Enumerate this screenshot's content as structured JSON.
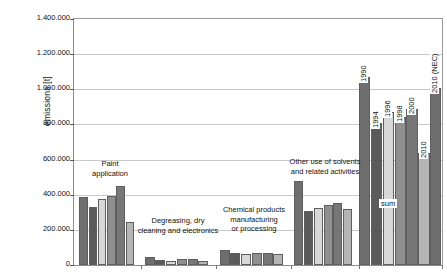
{
  "chart_data": {
    "type": "bar",
    "title": "",
    "xlabel": "",
    "ylabel": "emissions [t]",
    "ylim": [
      0,
      1400000
    ],
    "ytick_labels": [
      "0",
      "200.000",
      "400.000",
      "600.000",
      "800.000",
      "1.000.000",
      "1.200.000",
      "1.400.000"
    ],
    "ytick_values": [
      0,
      200000,
      400000,
      600000,
      800000,
      1000000,
      1200000,
      1400000
    ],
    "grid": "horizontal",
    "legend": "none",
    "series": [
      {
        "name": "1990",
        "color": "#6e6e6e"
      },
      {
        "name": "1994",
        "color": "#5a5a5a"
      },
      {
        "name": "1996",
        "color": "#d8d8d8"
      },
      {
        "name": "1998",
        "color": "#8f8f8f"
      },
      {
        "name": "2000",
        "color": "#777777"
      },
      {
        "name": "2010",
        "color": "#b5b5b5"
      },
      {
        "name": "2010 (NEC)",
        "color": "#6e6e6e"
      }
    ],
    "categories": [
      "Paint application",
      "Degreasing, dry cleaning and electronics",
      "Chemical products manufacturing or processing",
      "Other use of solvents and related activities",
      "sum"
    ],
    "groups": [
      {
        "category": "Paint application",
        "label_lines": "Paint\napplication",
        "values": [
          385000,
          330000,
          375000,
          395000,
          450000,
          245000
        ]
      },
      {
        "category": "Degreasing, dry cleaning and electronics",
        "label_lines": "Degreasing, dry\ncleaning and electronics",
        "values": [
          47000,
          27000,
          25000,
          32000,
          32000,
          22000
        ]
      },
      {
        "category": "Chemical products manufacturing or processing",
        "label_lines": "Chemical products\nmanufacturing\nor processing",
        "values": [
          85000,
          68000,
          63000,
          67000,
          67000,
          63000
        ]
      },
      {
        "category": "Other use of solvents and related activities",
        "label_lines": "Other use of solvents\nand related activities",
        "values": [
          480000,
          310000,
          325000,
          340000,
          355000,
          320000
        ]
      },
      {
        "category": "sum",
        "label_lines": "sum",
        "values": [
          1070000,
          810000,
          870000,
          840000,
          890000,
          640000,
          1010000
        ]
      }
    ],
    "sum_bar_annotations": [
      "1990",
      "1994",
      "1996",
      "1998",
      "2000",
      "2010",
      "2010 (NEC)"
    ],
    "colors": {
      "axis": "#8d8d8d",
      "grid": "#c9c9c9",
      "text": "#111111",
      "background": "#ffffff"
    }
  }
}
